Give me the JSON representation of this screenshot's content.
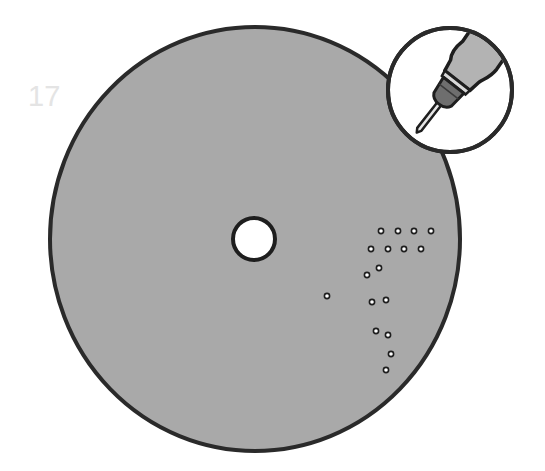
{
  "step": {
    "number": "17",
    "color": "#e4e4e4"
  },
  "disc": {
    "cx": 255,
    "cy": 239,
    "rx": 205,
    "ry": 212,
    "fill": "#a9a9a9",
    "stroke": "#2a2a2a",
    "center_hole": {
      "cx": 254,
      "cy": 239,
      "r": 21
    }
  },
  "drill_holes": [
    {
      "x": 381,
      "y": 231
    },
    {
      "x": 398,
      "y": 231
    },
    {
      "x": 414,
      "y": 231
    },
    {
      "x": 431,
      "y": 231
    },
    {
      "x": 371,
      "y": 249
    },
    {
      "x": 388,
      "y": 249
    },
    {
      "x": 404,
      "y": 249
    },
    {
      "x": 421,
      "y": 249
    },
    {
      "x": 379,
      "y": 268
    },
    {
      "x": 367,
      "y": 275
    },
    {
      "x": 327,
      "y": 296
    },
    {
      "x": 372,
      "y": 302
    },
    {
      "x": 386,
      "y": 300
    },
    {
      "x": 376,
      "y": 331
    },
    {
      "x": 388,
      "y": 335
    },
    {
      "x": 391,
      "y": 354
    },
    {
      "x": 386,
      "y": 370
    }
  ],
  "inset": {
    "cx": 450,
    "cy": 90,
    "r": 62,
    "icon": "drill-icon"
  }
}
